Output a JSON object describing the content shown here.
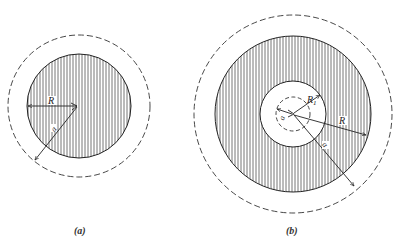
{
  "figure": {
    "panels": [
      {
        "id": "a",
        "caption": "(a)",
        "center": [
          78,
          106
        ],
        "conductor_radius_label": "R",
        "distance_label": "a",
        "conductor_radius_px": 51,
        "dashed_radius_px": 71
      },
      {
        "id": "b",
        "caption": "(b)",
        "center": [
          293,
          114
        ],
        "inner_radius_label": "R1",
        "inner_radius_label_main": "R",
        "inner_radius_label_sub": "1",
        "outer_radius_label": "R",
        "distance_label": "a",
        "inner_distance_label": "a",
        "hole_radius_px": 33,
        "inner_dashed_radius_px": 17,
        "conductor_radius_px": 78,
        "dashed_radius_px": 99
      }
    ],
    "colors": {
      "line": "#2a2a2a",
      "hatch": "#555555",
      "background": "#ffffff"
    }
  }
}
